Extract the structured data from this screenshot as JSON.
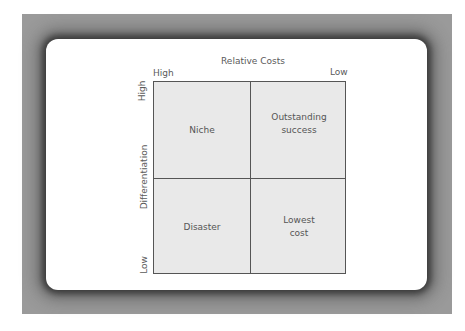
{
  "diagram": {
    "x_axis": {
      "title": "Relative Costs",
      "left_label": "High",
      "right_label": "Low"
    },
    "y_axis": {
      "title": "Differentiation",
      "top_label": "High",
      "bottom_label": "Low"
    },
    "quadrants": {
      "top_left": "Niche",
      "top_right_line1": "Outstanding",
      "top_right_line2": "success",
      "bottom_left": "Disaster",
      "bottom_right_line1": "Lowest",
      "bottom_right_line2": "cost"
    }
  }
}
